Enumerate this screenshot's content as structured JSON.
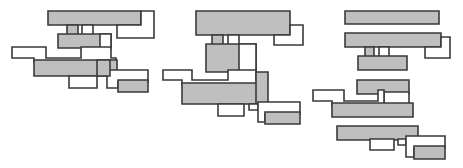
{
  "figure": {
    "canvas": {
      "width": 463,
      "height": 168
    },
    "background_color": "#ffffff",
    "stroke_color": "#3a3a3a",
    "fill_gray": "#bfbfbf",
    "fill_white": "#ffffff",
    "stroke_width": 1.6,
    "cluster_count": 3,
    "clusters": [
      {
        "name": "cluster-left",
        "label": "Left cluster",
        "shape_count": 9,
        "shapes": [
          {
            "name": "shape-l1",
            "fill": "gray",
            "path": "M48,10 L141,10 L141,20 L131,20 L131,30 L122,30 L122,20 L81,20 L81,30 L71,30 L71,20 L48,20 Z"
          },
          {
            "name": "shape-l2",
            "fill": "white",
            "path": "M81,20 L141,20 L141,10 L145,10 L145,24 L155,24 L155,34 L122,34 L122,30 L131,30 L131,20 L81,20 Z"
          },
          {
            "name": "shape-l3",
            "fill": "gray",
            "path": "M58,29 L110,29 L110,45 L80,45 L80,52 L71,52 L71,45 L58,45 Z"
          },
          {
            "name": "shape-l4",
            "fill": "white",
            "path": "M12,45 L46,45 L46,55 L80,55 L80,45 L110,45 L110,52 L116,52 L116,62 L34,62 L34,55 L12,55 Z"
          },
          {
            "name": "shape-l5",
            "fill": "gray",
            "path": "M34,55 L110,55 L110,45 L116,45 L116,62 L116,78 L68,78 L68,68 L34,68 Z"
          },
          {
            "name": "shape-l6",
            "fill": "white",
            "path": "M68,68 L116,68 L116,78 L98,78 L98,88 L68,88 Z"
          },
          {
            "name": "shape-l7",
            "fill": "gray",
            "path": "M98,62 L116,62 L116,78 L98,78 Z"
          },
          {
            "name": "shape-l8",
            "fill": "white",
            "path": "M110,72 L148,72 L148,88 L126,88 L126,78 L110,78 Z"
          },
          {
            "name": "shape-l9",
            "fill": "gray",
            "path": "M118,78 L148,78 L148,90 L118,90 Z"
          }
        ]
      },
      {
        "name": "cluster-middle",
        "label": "Middle cluster",
        "shape_count": 9,
        "shapes": []
      },
      {
        "name": "cluster-right",
        "label": "Right cluster",
        "shape_count": 10,
        "shapes": []
      }
    ],
    "legend": {
      "gray_meaning": "filled block",
      "white_meaning": "open block"
    }
  }
}
